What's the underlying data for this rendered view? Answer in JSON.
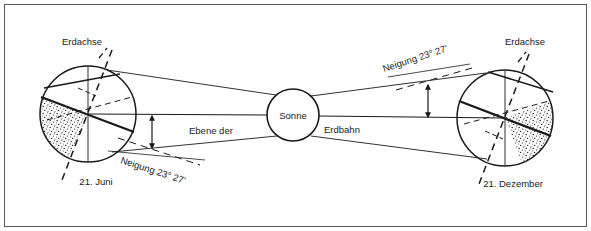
{
  "figure": {
    "title_visible": false,
    "background_color": "#ffffff",
    "ink_color": "#1a1a1a",
    "border": {
      "present": true,
      "color": "#5a5a5a",
      "width_px": 1
    }
  },
  "labels": {
    "earth_axis_left": "Erdachse",
    "earth_axis_right": "Erdachse",
    "date_left": "21. Juni",
    "date_right": "21. Dezember",
    "sun": "Sonne",
    "orbit_plane_part1": "Ebene der",
    "orbit_plane_part2": "Erdbahn",
    "tilt_left": "Neigung 23° 27'",
    "tilt_right": "Neigung 23° 27'"
  },
  "diagram_data": {
    "type": "astronomy-schematic",
    "subject": "Earth axial tilt at the solstices relative to the plane of the ecliptic",
    "language": "de",
    "axial_tilt_degrees": 23,
    "axial_tilt_arcminutes": 27,
    "axial_tilt_text": "23° 27'",
    "bodies": [
      {
        "name": "earth-summer-solstice",
        "label": "21. Juni",
        "center": [
          88,
          114
        ],
        "radius": 48,
        "axis_label": "Erdachse",
        "night_side": "left",
        "axis_tilt_direction": "top-leaning-right"
      },
      {
        "name": "sun",
        "label": "Sonne",
        "center": [
          293,
          115
        ],
        "radius": 26
      },
      {
        "name": "earth-winter-solstice",
        "label": "21. Dezember",
        "center": [
          505,
          118
        ],
        "radius": 48,
        "axis_label": "Erdachse",
        "night_side": "right",
        "axis_tilt_direction": "top-leaning-right"
      }
    ],
    "annotations": [
      {
        "name": "tilt-angle-left",
        "text": "Neigung 23° 27'",
        "marker": "double-headed-vertical-arrow",
        "rotation_deg": 18
      },
      {
        "name": "tilt-angle-right",
        "text": "Neigung 23° 27'",
        "marker": "double-headed-vertical-arrow",
        "rotation_deg": -18
      },
      {
        "name": "orbit-plane-line",
        "text": "Ebene der Erdbahn",
        "style": "horizontal-axis-line"
      }
    ]
  }
}
